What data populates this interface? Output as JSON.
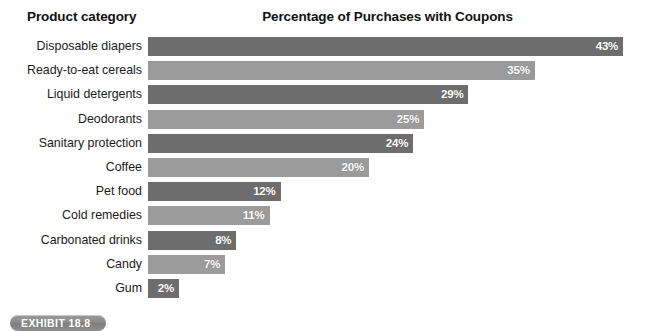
{
  "header": {
    "category_column": "Product category",
    "title": "Percentage of Purchases with Coupons"
  },
  "exhibit": {
    "label": "EXHIBIT 18.8"
  },
  "colors": {
    "bar_dark": "#6d6d6d",
    "bar_light": "#9b9b9b",
    "value_text": "#ffffff",
    "background": "#fefefe",
    "badge": "#8a8a8a"
  },
  "chart_data": {
    "type": "bar",
    "orientation": "horizontal",
    "title": "Percentage of Purchases with Coupons",
    "xlabel": "",
    "ylabel": "Product category",
    "xlim": [
      0,
      43
    ],
    "grid": false,
    "legend": null,
    "value_suffix": "%",
    "categories": [
      "Disposable diapers",
      "Ready-to-eat cereals",
      "Liquid detergents",
      "Deodorants",
      "Sanitary protection",
      "Coffee",
      "Pet food",
      "Cold remedies",
      "Carbonated drinks",
      "Candy",
      "Gum"
    ],
    "values": [
      43,
      35,
      29,
      25,
      24,
      20,
      12,
      11,
      8,
      7,
      2
    ],
    "labels": [
      "43%",
      "35%",
      "29%",
      "25%",
      "24%",
      "20%",
      "12%",
      "11%",
      "8%",
      "7%",
      "2%"
    ],
    "bar_colors": [
      "#6d6d6d",
      "#9b9b9b",
      "#6d6d6d",
      "#9b9b9b",
      "#6d6d6d",
      "#9b9b9b",
      "#6d6d6d",
      "#9b9b9b",
      "#6d6d6d",
      "#9b9b9b",
      "#6d6d6d"
    ]
  }
}
